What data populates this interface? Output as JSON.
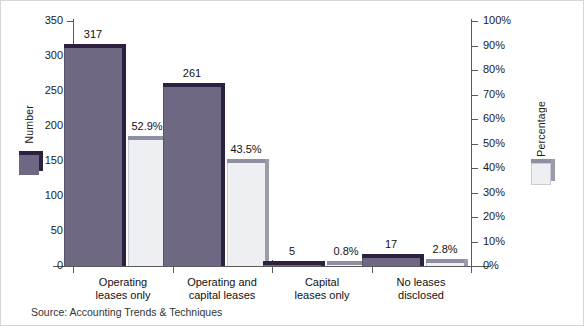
{
  "chart_data": {
    "type": "bar",
    "title": "",
    "categories": [
      "Operating\nleases only",
      "Operating and\ncapital leases",
      "Capital\nleases only",
      "No leases\ndisclosed"
    ],
    "category_lines": [
      [
        "Operating",
        "leases only"
      ],
      [
        "Operating and",
        "capital leases"
      ],
      [
        "Capital",
        "leases only"
      ],
      [
        "No leases",
        "disclosed"
      ]
    ],
    "series": [
      {
        "name": "Number",
        "axis": "left",
        "color": "#6f6883",
        "values": [
          317,
          261,
          5,
          17
        ],
        "data_labels": [
          "317",
          "261",
          "5",
          "17"
        ]
      },
      {
        "name": "Percentage",
        "axis": "right",
        "color": "#edeff3",
        "values": [
          52.9,
          43.5,
          0.8,
          2.8
        ],
        "data_labels": [
          "52.9%",
          "43.5%",
          "0.8%",
          "2.8%"
        ]
      }
    ],
    "left_axis": {
      "label": "Number",
      "min": 0,
      "max": 350,
      "step": 50,
      "ticks": [
        0,
        50,
        100,
        150,
        200,
        250,
        300,
        350
      ],
      "tick_labels": [
        "0",
        "50",
        "100",
        "150",
        "200",
        "250",
        "300",
        "350"
      ]
    },
    "right_axis": {
      "label": "Percentage",
      "min": 0,
      "max": 100,
      "step": 10,
      "ticks": [
        0,
        10,
        20,
        30,
        40,
        50,
        60,
        70,
        80,
        90,
        100
      ],
      "tick_labels": [
        "0%",
        "10%",
        "20%",
        "30%",
        "40%",
        "50%",
        "60%",
        "70%",
        "80%",
        "90%",
        "100%"
      ]
    },
    "xlabel": "",
    "grid": false,
    "legend_position": "axis-inline"
  },
  "source": "Source: Accounting Trends & Techniques"
}
